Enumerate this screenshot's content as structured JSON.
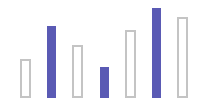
{
  "chart_data": {
    "type": "bar",
    "title": "",
    "xlabel": "",
    "ylabel": "",
    "grid": false,
    "legend": null,
    "categories": [
      "1",
      "2",
      "3",
      "4",
      "5",
      "6",
      "7"
    ],
    "values": [
      39,
      72,
      53,
      31,
      68,
      90,
      81
    ],
    "styles": [
      "outline",
      "filled",
      "outline",
      "filled",
      "outline",
      "filled",
      "outline"
    ],
    "ylim": [
      0,
      100
    ],
    "colors": {
      "filled": "#5a5ab4",
      "outline_border": "#c4c4c4",
      "outline_fill": "#ffffff"
    },
    "layout": {
      "baseline_y": 98,
      "x_positions": [
        20,
        47,
        72,
        100,
        125,
        152,
        177
      ],
      "widths": [
        11,
        9,
        11,
        9,
        11,
        9,
        11
      ]
    }
  }
}
